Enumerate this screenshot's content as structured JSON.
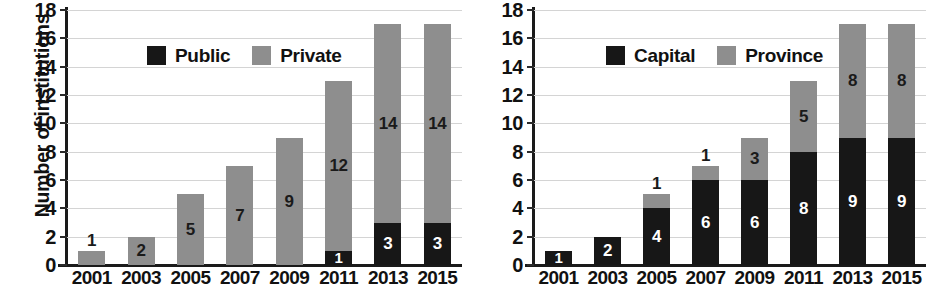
{
  "chart_data": [
    {
      "id": "left",
      "type": "bar",
      "stacked": true,
      "title": "",
      "xlabel": "",
      "ylabel": "Number of institutions",
      "ylim": [
        0,
        18
      ],
      "ytick_step": 2,
      "yticks": [
        0,
        2,
        4,
        6,
        8,
        10,
        12,
        14,
        16,
        18
      ],
      "grid": true,
      "legend_position": "upper-left-inside",
      "categories": [
        "2001",
        "2003",
        "2005",
        "2007",
        "2009",
        "2011",
        "2013",
        "2015"
      ],
      "series": [
        {
          "name": "Public",
          "color": "#171717",
          "values": [
            0,
            0,
            0,
            0,
            0,
            1,
            3,
            3
          ],
          "labels": [
            "",
            "",
            "",
            "",
            "",
            "1",
            "3",
            "3"
          ]
        },
        {
          "name": "Private",
          "color": "#8e8e8e",
          "values": [
            1,
            2,
            5,
            7,
            9,
            12,
            14,
            14
          ],
          "labels": [
            "1",
            "2",
            "5",
            "7",
            "9",
            "12",
            "14",
            "14"
          ]
        }
      ],
      "totals": [
        1,
        2,
        5,
        7,
        9,
        13,
        17,
        17
      ]
    },
    {
      "id": "right",
      "type": "bar",
      "stacked": true,
      "title": "",
      "xlabel": "",
      "ylabel": "",
      "ylim": [
        0,
        18
      ],
      "ytick_step": 2,
      "yticks": [
        0,
        2,
        4,
        6,
        8,
        10,
        12,
        14,
        16,
        18
      ],
      "grid": true,
      "legend_position": "upper-left-inside",
      "categories": [
        "2001",
        "2003",
        "2005",
        "2007",
        "2009",
        "2011",
        "2013",
        "2015"
      ],
      "series": [
        {
          "name": "Capital",
          "color": "#171717",
          "values": [
            1,
            2,
            4,
            6,
            6,
            8,
            9,
            9
          ],
          "labels": [
            "1",
            "2",
            "4",
            "6",
            "6",
            "8",
            "9",
            "9"
          ]
        },
        {
          "name": "Province",
          "color": "#8e8e8e",
          "values": [
            0,
            0,
            1,
            1,
            3,
            5,
            8,
            8
          ],
          "labels": [
            "",
            "",
            "1",
            "1",
            "3",
            "5",
            "8",
            "8"
          ]
        }
      ],
      "totals": [
        1,
        2,
        5,
        7,
        9,
        13,
        17,
        17
      ]
    }
  ],
  "colors": {
    "black": "#171717",
    "gray": "#8e8e8e",
    "axis": "#1a1a1a",
    "grid": "#d4d4d4",
    "background": "#ffffff"
  }
}
